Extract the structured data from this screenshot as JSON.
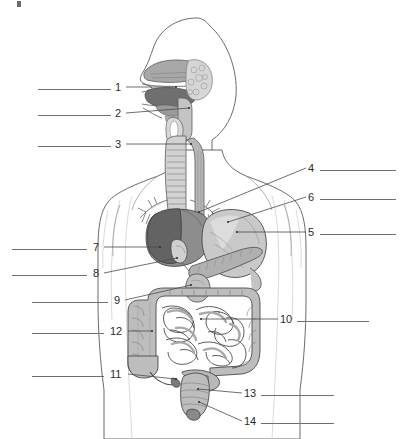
{
  "figure": {
    "type": "anatomical-worksheet",
    "view": "sagittal / anterior composite",
    "background_color": "#ffffff",
    "line_color": "#4a4a4a",
    "answer_line_color": "#6f6f6f",
    "number_color": "#2b2b2b"
  },
  "palette": {
    "outline": "#555555",
    "liver_dark": "#6a6a6a",
    "liver_mid": "#8d8d8d",
    "stomach": "#c9c9c9",
    "pancreas": "#b0b0b0",
    "intestine": "#bdbdbd",
    "intestine_shade": "#a3a3a3",
    "nasal": "#a8a8a8",
    "tongue": "#6f6f6f",
    "body_fill": "#ffffff",
    "torso_shade": "#f2f2f2"
  },
  "labels": [
    {
      "id": "1",
      "number": "1",
      "side": "left",
      "num_x": 115,
      "num_y": 82,
      "line_x": 38,
      "line_y": 89,
      "line_w": 73,
      "leader_x1": 126,
      "leader_y1": 87,
      "leader_x2": 176,
      "leader_y2": 87,
      "answer_text": ""
    },
    {
      "id": "2",
      "number": "2",
      "side": "left",
      "num_x": 115,
      "num_y": 108,
      "line_x": 38,
      "line_y": 115,
      "line_w": 73,
      "leader_x1": 126,
      "leader_y1": 113,
      "leader_x2": 189,
      "leader_y2": 108,
      "answer_text": ""
    },
    {
      "id": "3",
      "number": "3",
      "side": "left",
      "num_x": 115,
      "num_y": 139,
      "line_x": 38,
      "line_y": 146,
      "line_w": 73,
      "leader_x1": 126,
      "leader_y1": 144,
      "leader_x2": 191,
      "leader_y2": 144,
      "answer_text": ""
    },
    {
      "id": "4",
      "number": "4",
      "side": "right",
      "num_x": 308,
      "num_y": 163,
      "line_x": 320,
      "line_y": 170,
      "line_w": 76,
      "leader_x1": 306,
      "leader_y1": 168,
      "leader_x2": 199,
      "leader_y2": 212,
      "answer_text": ""
    },
    {
      "id": "6",
      "number": "6",
      "side": "right",
      "num_x": 308,
      "num_y": 192,
      "line_x": 320,
      "line_y": 199,
      "line_w": 76,
      "leader_x1": 306,
      "leader_y1": 197,
      "leader_x2": 228,
      "leader_y2": 222,
      "answer_text": ""
    },
    {
      "id": "5",
      "number": "5",
      "side": "right",
      "num_x": 308,
      "num_y": 227,
      "line_x": 320,
      "line_y": 234,
      "line_w": 76,
      "leader_x1": 306,
      "leader_y1": 232,
      "leader_x2": 237,
      "leader_y2": 232,
      "answer_text": ""
    },
    {
      "id": "7",
      "number": "7",
      "side": "left",
      "num_x": 93,
      "num_y": 242,
      "line_x": 12,
      "line_y": 249,
      "line_w": 75,
      "leader_x1": 104,
      "leader_y1": 247,
      "leader_x2": 160,
      "leader_y2": 247,
      "answer_text": ""
    },
    {
      "id": "8",
      "number": "8",
      "side": "left",
      "num_x": 93,
      "num_y": 268,
      "line_x": 12,
      "line_y": 275,
      "line_w": 75,
      "leader_x1": 104,
      "leader_y1": 273,
      "leader_x2": 177,
      "leader_y2": 258,
      "answer_text": ""
    },
    {
      "id": "9",
      "number": "9",
      "side": "left",
      "num_x": 114,
      "num_y": 295,
      "line_x": 32,
      "line_y": 302,
      "line_w": 76,
      "leader_x1": 125,
      "leader_y1": 300,
      "leader_x2": 191,
      "leader_y2": 285,
      "answer_text": ""
    },
    {
      "id": "10",
      "number": "10",
      "side": "right",
      "num_x": 280,
      "num_y": 314,
      "line_x": 297,
      "line_y": 321,
      "line_w": 72,
      "leader_x1": 278,
      "leader_y1": 319,
      "leader_x2": 201,
      "leader_y2": 319,
      "answer_text": ""
    },
    {
      "id": "12",
      "number": "12",
      "side": "left",
      "num_x": 110,
      "num_y": 326,
      "line_x": 32,
      "line_y": 333,
      "line_w": 72,
      "leader_x1": 128,
      "leader_y1": 331,
      "leader_x2": 152,
      "leader_y2": 331,
      "answer_text": ""
    },
    {
      "id": "11",
      "number": "11",
      "side": "left",
      "num_x": 110,
      "num_y": 369,
      "line_x": 32,
      "line_y": 376,
      "line_w": 72,
      "leader_x1": 128,
      "leader_y1": 374,
      "leader_x2": 176,
      "leader_y2": 379,
      "answer_text": ""
    },
    {
      "id": "13",
      "number": "13",
      "side": "right",
      "num_x": 244,
      "num_y": 388,
      "line_x": 261,
      "line_y": 395,
      "line_w": 73,
      "leader_x1": 242,
      "leader_y1": 393,
      "leader_x2": 198,
      "leader_y2": 389,
      "answer_text": ""
    },
    {
      "id": "14",
      "number": "14",
      "side": "right",
      "num_x": 244,
      "num_y": 416,
      "line_x": 261,
      "line_y": 423,
      "line_w": 73,
      "leader_x1": 242,
      "leader_y1": 421,
      "leader_x2": 199,
      "leader_y2": 402,
      "answer_text": ""
    }
  ],
  "organs": [
    {
      "name": "nasal-cavity"
    },
    {
      "name": "tongue"
    },
    {
      "name": "pharynx"
    },
    {
      "name": "trachea"
    },
    {
      "name": "esophagus"
    },
    {
      "name": "liver"
    },
    {
      "name": "gallbladder"
    },
    {
      "name": "stomach"
    },
    {
      "name": "pancreas"
    },
    {
      "name": "duodenum"
    },
    {
      "name": "small-intestine"
    },
    {
      "name": "large-intestine"
    },
    {
      "name": "cecum"
    },
    {
      "name": "appendix"
    },
    {
      "name": "rectum"
    },
    {
      "name": "anus"
    }
  ]
}
